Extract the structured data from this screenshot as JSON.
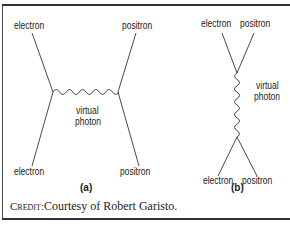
{
  "diagram_a": {
    "top_left": "electron",
    "top_right": "positron",
    "mid_line1": "virtual",
    "mid_line2": "photon",
    "bottom_left": "electron",
    "bottom_right": "positron",
    "caption": "(a)"
  },
  "diagram_b": {
    "top_left": "electron",
    "top_right": "positron",
    "mid_line1": "virtual",
    "mid_line2": "photon",
    "bottom_left": "electron",
    "bottom_right": "positron",
    "caption": "(b)"
  },
  "credit": {
    "prefix": "Credit:",
    "text": "Courtesy of Robert Garisto."
  }
}
